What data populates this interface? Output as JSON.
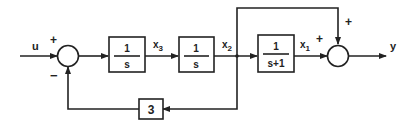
{
  "diagram": {
    "type": "block-diagram",
    "input": {
      "label": "u"
    },
    "output": {
      "label": "y"
    },
    "summing_junction_1": {
      "plus_sign": "+",
      "minus_sign": "−"
    },
    "summing_junction_2": {
      "plus_sign_left": "+",
      "plus_sign_top": "+"
    },
    "blocks": [
      {
        "id": "integrator-1",
        "numerator": "1",
        "denominator": "s"
      },
      {
        "id": "integrator-2",
        "numerator": "1",
        "denominator": "s"
      },
      {
        "id": "first-order-lag",
        "numerator": "1",
        "denominator": "s+1"
      },
      {
        "id": "feedback-gain",
        "value": "3"
      }
    ],
    "signals": {
      "x3": "x",
      "x3_sub": "3",
      "x2": "x",
      "x2_sub": "2",
      "x1": "x",
      "x1_sub": "1"
    }
  }
}
